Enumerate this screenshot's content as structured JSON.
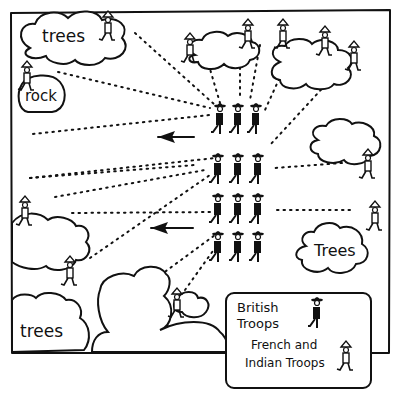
{
  "diagram": {
    "labels": {
      "trees_top_left": "trees",
      "rock": "rock",
      "trees_right": "Trees",
      "trees_bottom_left": "trees"
    },
    "legend": {
      "british": "British\nTroops",
      "british_line1": "British",
      "british_line2": "Troops",
      "french_line1": "French and",
      "french_line2": "Indian Troops"
    },
    "colors": {
      "ink": "#111111",
      "background": "#ffffff"
    },
    "british_formation": {
      "rows": 4,
      "columns": 3
    },
    "arrows": [
      {
        "direction": "left",
        "y": 137
      },
      {
        "direction": "left",
        "y": 228
      }
    ]
  }
}
